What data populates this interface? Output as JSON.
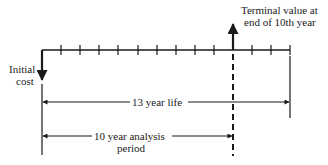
{
  "diagram": {
    "type": "cash-flow timeline",
    "periods_total": 13,
    "analysis_periods": 10,
    "labels": {
      "initial_cost_line1": "Initial",
      "initial_cost_line2": "cost",
      "terminal_value_line1": "Terminal value at",
      "terminal_value_line2": "end of 10th year",
      "life_span": "13 year life",
      "analysis_line1": "10 year analysis",
      "analysis_line2": "period"
    },
    "colors": {
      "ink": "#1a1a1a",
      "background": "#ffffff"
    }
  }
}
